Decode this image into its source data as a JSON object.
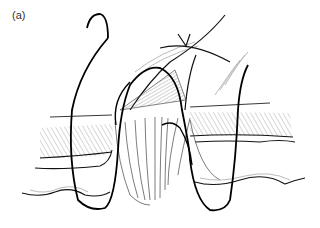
{
  "figure": {
    "panel_label": "(a)",
    "colors": {
      "line": "#111111",
      "hatch": "#555555",
      "faint": "#aaaaaa",
      "background": "#ffffff"
    }
  }
}
